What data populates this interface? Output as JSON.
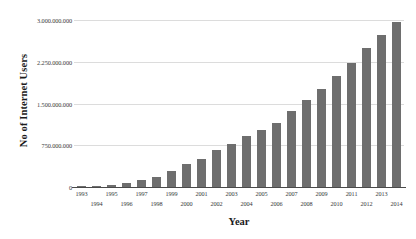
{
  "chart_data": {
    "type": "bar",
    "title": "",
    "xlabel": "Year",
    "ylabel": "No of Internet Users",
    "categories": [
      "1993",
      "1994",
      "1995",
      "1996",
      "1997",
      "1998",
      "1999",
      "2000",
      "2001",
      "2002",
      "2003",
      "2004",
      "2005",
      "2006",
      "2007",
      "2008",
      "2009",
      "2010",
      "2011",
      "2012",
      "2013",
      "2014"
    ],
    "values": [
      14000000,
      25000000,
      44000000,
      77000000,
      120000000,
      188000000,
      281000000,
      414000000,
      502000000,
      663000000,
      778000000,
      910000000,
      1023000000,
      1151000000,
      1373000000,
      1562000000,
      1752000000,
      1991000000,
      2231000000,
      2494000000,
      2728000000,
      2956000000
    ],
    "ylim": [
      0,
      3000000000
    ],
    "ytick_values": [
      0,
      750000000,
      1500000000,
      2250000000,
      3000000000
    ],
    "ytick_labels": [
      "0",
      "750.000.000",
      "1.500.000.000",
      "2.250.000.000",
      "3.000.000.000"
    ],
    "grid": true,
    "legend": "none",
    "bar_color": "#6e6e6e",
    "gridline_color": "#dcdcdc",
    "axis_color": "#4a4a4a",
    "background_color": "#ffffff"
  }
}
